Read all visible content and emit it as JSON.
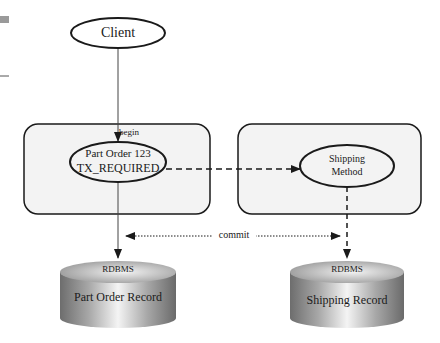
{
  "diagram": {
    "nodes": {
      "client": {
        "label": "Client"
      },
      "part_order": {
        "line1": "Part Order 123",
        "line2": "TX_REQUIRED"
      },
      "shipping": {
        "line1": "Shipping",
        "line2": "Method"
      },
      "left_db": {
        "top_label": "RDBMS",
        "body_label": "Part Order Record"
      },
      "right_db": {
        "top_label": "RDBMS",
        "body_label": "Shipping Record"
      }
    },
    "edges": {
      "begin": {
        "label": "begin",
        "style": "solid"
      },
      "call": {
        "label": "",
        "style": "dashed"
      },
      "commit": {
        "label": "commit",
        "style": "dotted"
      }
    },
    "colors": {
      "container_fill": "#f3f3f3",
      "stroke": "#1a1a1a",
      "left_margin_mark": "#9a9a9a"
    }
  }
}
